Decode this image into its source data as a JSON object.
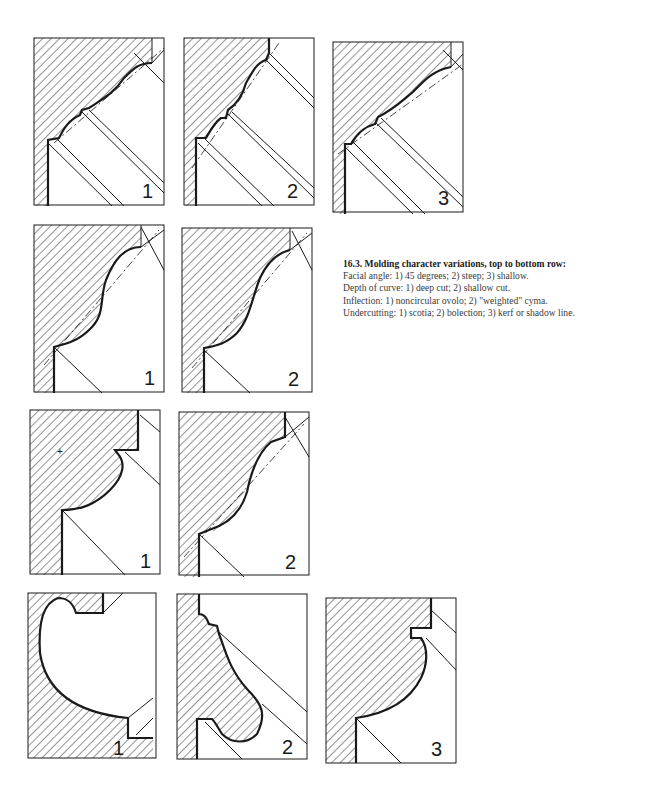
{
  "figure": {
    "caption": {
      "title": "16.3. Molding character variations, top to bottom row:",
      "lines": [
        "Facial angle: 1) 45 degrees; 2) steep; 3) shallow.",
        "Depth of curve: 1) deep cut; 2) shallow cut.",
        "Inflection: 1) noncircular ovolo; 2) \"weighted\" cyma.",
        "Undercutting: 1) scotia; 2) bolection; 3) kerf or shadow line."
      ]
    },
    "rows": [
      {
        "name": "Facial angle",
        "panels": [
          {
            "label": "1",
            "variant": "45 degrees"
          },
          {
            "label": "2",
            "variant": "steep"
          },
          {
            "label": "3",
            "variant": "shallow"
          }
        ]
      },
      {
        "name": "Depth of curve",
        "panels": [
          {
            "label": "1",
            "variant": "deep cut"
          },
          {
            "label": "2",
            "variant": "shallow cut"
          }
        ]
      },
      {
        "name": "Inflection",
        "panels": [
          {
            "label": "1",
            "variant": "noncircular ovolo"
          },
          {
            "label": "2",
            "variant": "weighted cyma"
          }
        ]
      },
      {
        "name": "Undercutting",
        "panels": [
          {
            "label": "1",
            "variant": "scotia"
          },
          {
            "label": "2",
            "variant": "bolection"
          },
          {
            "label": "3",
            "variant": "kerf or shadow line"
          }
        ]
      }
    ],
    "colors": {
      "ink": "#1a1a1a",
      "paper": "#ffffff",
      "hatch": "#2a2a2a"
    }
  }
}
